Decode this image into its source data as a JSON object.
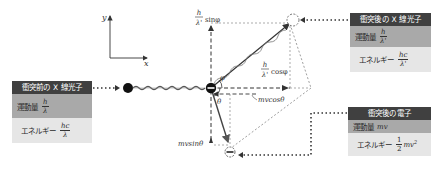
{
  "axes": {
    "x_label": "x",
    "y_label": "y"
  },
  "boxes": {
    "before_photon": {
      "title": "衝突前の X 線光子",
      "momentum_label": "運動量",
      "momentum_num": "h",
      "momentum_den": "λ",
      "energy_label": "エネルギー",
      "energy_num": "hc",
      "energy_den": "λ"
    },
    "after_photon": {
      "title": "衝突後の X 線光子",
      "momentum_label": "運動量",
      "momentum_num": "h",
      "momentum_den": "λ'",
      "energy_label": "エネルギー",
      "energy_num": "hc",
      "energy_den": "λ'"
    },
    "after_electron": {
      "title": "衝突後の電子",
      "momentum_label": "運動量",
      "momentum_value": "mv",
      "energy_label": "エネルギー",
      "energy_num": "1",
      "energy_den": "2",
      "energy_value": "mv",
      "energy_exp": "2"
    }
  },
  "labels": {
    "photon_y_num": "h",
    "photon_y_den": "λ'",
    "photon_y_fn": "sinφ",
    "photon_x_num": "h",
    "photon_x_den": "λ'",
    "photon_x_fn": "cosφ",
    "electron_x": "mvcosθ",
    "electron_y": "mvsinθ",
    "angle_phi": "φ",
    "angle_theta": "θ"
  },
  "colors": {
    "header": "#404040",
    "momentum_row": "#a9a9a9",
    "energy_row": "#e6e6e6",
    "line": "#333333"
  }
}
